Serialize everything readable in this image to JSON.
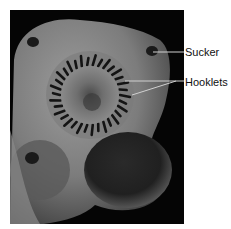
{
  "figure": {
    "labels": [
      {
        "id": "sucker",
        "text": "Sucker"
      },
      {
        "id": "hooklets",
        "text": "Hooklets"
      }
    ],
    "colors": {
      "background": "#000000",
      "tissue_light": "#9a9a9a",
      "tissue_mid": "#6e6e6e",
      "tissue_dark": "#2a2a2a",
      "hooks": "#141414",
      "leader_line": "#cfcfcf",
      "label_text": "#111111"
    }
  }
}
